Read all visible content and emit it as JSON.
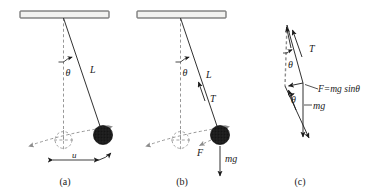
{
  "figure": {
    "background_color": "#ffffff",
    "ink_color": "#1a1a1a",
    "dash_color": "#8c8c8c",
    "bob_color": "#1c1c1c",
    "ceiling_fill": "#f2f2f0"
  },
  "panels": [
    {
      "id": "a",
      "caption": "(a)",
      "labels": {
        "theta": "θ",
        "length": "L",
        "amplitude": "u"
      }
    },
    {
      "id": "b",
      "caption": "(b)",
      "labels": {
        "theta": "θ",
        "length": "L",
        "tension": "T",
        "restoring_force": "F",
        "weight": "mg"
      }
    },
    {
      "id": "c",
      "caption": "(c)",
      "labels": {
        "tension": "T",
        "theta_upper": "θ",
        "theta_lower": "θ",
        "force_equation": "F=mg sinθ",
        "weight": "mg"
      }
    }
  ]
}
